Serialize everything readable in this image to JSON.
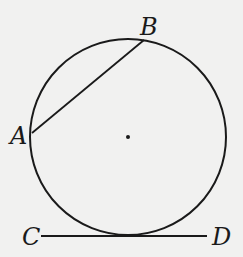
{
  "diagram": {
    "circle": {
      "cx": 128,
      "cy": 137,
      "r": 98,
      "stroke": "#1a1a1a"
    },
    "center_dot": {
      "cx": 128,
      "cy": 137,
      "r": 2
    },
    "chord_AB": {
      "x1": 32,
      "y1": 133,
      "x2": 144,
      "y2": 40
    },
    "tangent_CD": {
      "x1": 41,
      "y1": 236,
      "x2": 207,
      "y2": 236
    },
    "labels": {
      "A": "A",
      "B": "B",
      "C": "C",
      "D": "D"
    }
  }
}
